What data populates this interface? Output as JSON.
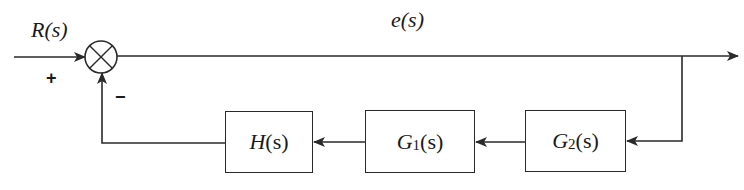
{
  "diagram": {
    "type": "control-system-block-diagram",
    "input_label": "R(s)",
    "error_label": "e(s)",
    "summing_junction": {
      "plus_sign": "+",
      "minus_sign": "−"
    },
    "blocks": [
      {
        "id": "G2",
        "fn": "G",
        "sub": "2",
        "arg": "(s)",
        "label": "G2(s)"
      },
      {
        "id": "G1",
        "fn": "G",
        "sub": "1",
        "arg": "(s)",
        "label": "G1(s)"
      },
      {
        "id": "H",
        "fn": "H",
        "sub": "",
        "arg": "(s)",
        "label": "H(s)"
      }
    ],
    "connections": [
      "R(s) -> summing junction (+)",
      "summing junction -> e(s) -> output",
      "output branch -> G2(s)",
      "G2(s) -> G1(s)",
      "G1(s) -> H(s)",
      "H(s) -> summing junction (−)"
    ],
    "colors": {
      "line": "#2a2a2a",
      "background": "#ffffff"
    }
  }
}
